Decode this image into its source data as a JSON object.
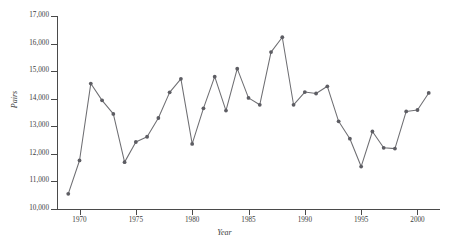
{
  "chart_data": {
    "type": "line",
    "title": "",
    "xlabel": "Year",
    "ylabel": "Pairs",
    "xlim": [
      1968,
      2002
    ],
    "ylim": [
      10000,
      17000
    ],
    "grid": false,
    "legend": "none",
    "y_ticks": [
      "10,000",
      "11,000",
      "12,000",
      "13,000",
      "14,000",
      "15,000",
      "16,000",
      "17,000"
    ],
    "y_tick_values": [
      10000,
      11000,
      12000,
      13000,
      14000,
      15000,
      16000,
      17000
    ],
    "x_ticks": [
      "1970",
      "1975",
      "1980",
      "1985",
      "1990",
      "1995",
      "2000"
    ],
    "x_tick_values": [
      1970,
      1975,
      1980,
      1985,
      1990,
      1995,
      2000
    ],
    "x": [
      1969,
      1970,
      1971,
      1972,
      1973,
      1974,
      1975,
      1976,
      1977,
      1978,
      1979,
      1980,
      1981,
      1982,
      1983,
      1984,
      1985,
      1986,
      1987,
      1988,
      1989,
      1990,
      1991,
      1992,
      1993,
      1994,
      1995,
      1996,
      1997,
      1998,
      1999,
      2000,
      2001
    ],
    "values": [
      10550,
      11760,
      14550,
      13940,
      13450,
      11700,
      12430,
      12620,
      13300,
      14230,
      14720,
      12360,
      13650,
      14800,
      13570,
      15090,
      14030,
      13780,
      15690,
      16230,
      13780,
      14240,
      14190,
      14450,
      13180,
      12550,
      11540,
      12810,
      12220,
      12190,
      13540,
      13590,
      14210
    ],
    "series_name": "Pairs",
    "marker": "circle",
    "line_color": "#6e6e72",
    "marker_color": "#5d5d63",
    "axis_color": "#4a4a4a",
    "background": "#ffffff"
  }
}
